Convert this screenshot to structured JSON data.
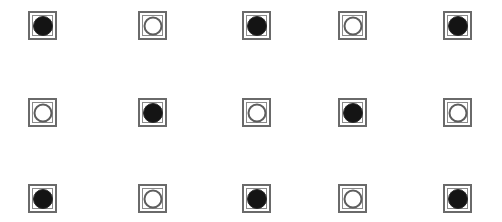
{
  "grid": {
    "rows": 3,
    "cols": 5,
    "col_x": [
      28,
      138,
      242,
      338,
      443
    ],
    "row_y": [
      11,
      98,
      184
    ],
    "cells": [
      [
        "filled",
        "hollow",
        "filled",
        "hollow",
        "filled"
      ],
      [
        "hollow",
        "filled",
        "hollow",
        "filled",
        "hollow"
      ],
      [
        "filled",
        "hollow",
        "filled",
        "hollow",
        "filled"
      ]
    ]
  },
  "colors": {
    "filled": "#141414",
    "hollow_stroke": "#5e5e5e",
    "square_border": "#6a6a6a",
    "background": "#ffffff"
  }
}
